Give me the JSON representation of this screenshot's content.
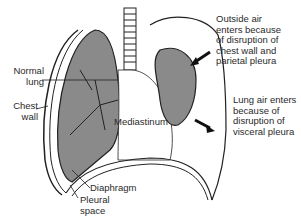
{
  "figure": {
    "labels": {
      "normal_lung": "Normal\n  lung",
      "chest_wall": "Chest\n  wall",
      "mediastinum": "Mediastinum",
      "diaphragm": "Diaphragm",
      "pleural_space": "Pleural\nspace",
      "outside_air": "Outside air\nenters because\nof disruption of\nchest wall and\nparietal pleura",
      "lung_air": "Lung air enters\nbecause of\ndisruption of\nvisceral pleura"
    },
    "colors": {
      "lung_fill": "#8a8a8a",
      "outline": "#222222",
      "background": "#ffffff"
    }
  }
}
